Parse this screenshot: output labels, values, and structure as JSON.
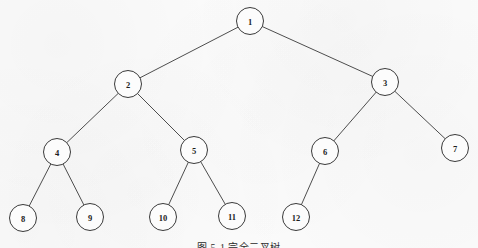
{
  "figure": {
    "type": "binary-tree-diagram",
    "caption": "图 5-1  完全二叉树",
    "background_color": "#fbfbfb",
    "stroke_color": "#2f2f2f",
    "node_fill_color": "#fcfcfc",
    "node_radius": 13.5,
    "canvas": {
      "width": 478,
      "height": 248
    }
  },
  "tree": {
    "root": "1",
    "nodes": [
      {
        "id": "1",
        "label": "1",
        "x": 250,
        "y": 21,
        "level": 0
      },
      {
        "id": "2",
        "label": "2",
        "x": 128,
        "y": 84,
        "level": 1
      },
      {
        "id": "3",
        "label": "3",
        "x": 385,
        "y": 82,
        "level": 1
      },
      {
        "id": "4",
        "label": "4",
        "x": 57,
        "y": 152,
        "level": 2
      },
      {
        "id": "5",
        "label": "5",
        "x": 194,
        "y": 150,
        "level": 2
      },
      {
        "id": "6",
        "label": "6",
        "x": 325,
        "y": 151,
        "level": 2
      },
      {
        "id": "7",
        "label": "7",
        "x": 455,
        "y": 148,
        "level": 2
      },
      {
        "id": "8",
        "label": "8",
        "x": 23,
        "y": 218,
        "level": 3
      },
      {
        "id": "9",
        "label": "9",
        "x": 90,
        "y": 217,
        "level": 3
      },
      {
        "id": "10",
        "label": "10",
        "x": 163,
        "y": 217,
        "level": 3
      },
      {
        "id": "11",
        "label": "11",
        "x": 232,
        "y": 216,
        "level": 3
      },
      {
        "id": "12",
        "label": "12",
        "x": 296,
        "y": 217,
        "level": 3
      }
    ],
    "edges": [
      {
        "from": "1",
        "to": "2"
      },
      {
        "from": "1",
        "to": "3"
      },
      {
        "from": "2",
        "to": "4"
      },
      {
        "from": "2",
        "to": "5"
      },
      {
        "from": "3",
        "to": "6"
      },
      {
        "from": "3",
        "to": "7"
      },
      {
        "from": "4",
        "to": "8"
      },
      {
        "from": "4",
        "to": "9"
      },
      {
        "from": "5",
        "to": "10"
      },
      {
        "from": "5",
        "to": "11"
      },
      {
        "from": "6",
        "to": "12"
      }
    ]
  }
}
